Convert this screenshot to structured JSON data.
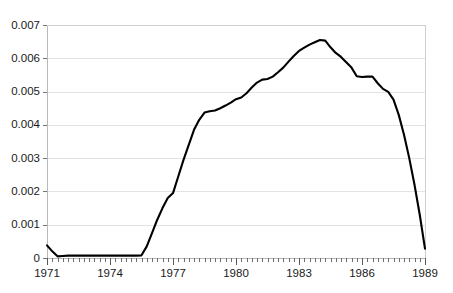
{
  "chart_data": {
    "type": "line",
    "title": "",
    "xlabel": "",
    "ylabel": "",
    "xlim": [
      1971,
      1989
    ],
    "ylim": [
      0,
      0.007
    ],
    "grid": true,
    "legend": null,
    "x_tick_labels": [
      "1971",
      "1974",
      "1977",
      "1980",
      "1983",
      "1986",
      "1989"
    ],
    "x_tick_values": [
      1971,
      1974,
      1977,
      1980,
      1983,
      1986,
      1989
    ],
    "x_minor_tick_interval": 0.25,
    "y_tick_labels": [
      "0",
      "0.001",
      "0.002",
      "0.003",
      "0.004",
      "0.005",
      "0.006",
      "0.007"
    ],
    "y_tick_values": [
      0,
      0.001,
      0.002,
      0.003,
      0.004,
      0.005,
      0.006,
      0.007
    ],
    "series": [
      {
        "name": "series-1",
        "color": "#000000",
        "x": [
          1971.0,
          1971.25,
          1971.5,
          1971.75,
          1972.0,
          1972.25,
          1972.5,
          1972.75,
          1973.0,
          1973.25,
          1973.5,
          1973.75,
          1974.0,
          1974.25,
          1974.5,
          1974.75,
          1975.0,
          1975.25,
          1975.5,
          1975.75,
          1976.0,
          1976.25,
          1976.5,
          1976.75,
          1977.0,
          1977.25,
          1977.5,
          1977.75,
          1978.0,
          1978.25,
          1978.5,
          1978.75,
          1979.0,
          1979.25,
          1979.5,
          1979.75,
          1980.0,
          1980.25,
          1980.5,
          1980.75,
          1981.0,
          1981.25,
          1981.5,
          1981.75,
          1982.0,
          1982.25,
          1982.5,
          1982.75,
          1983.0,
          1983.25,
          1983.5,
          1983.75,
          1984.0,
          1984.25,
          1984.5,
          1984.75,
          1985.0,
          1985.25,
          1985.5,
          1985.75,
          1986.0,
          1986.25,
          1986.5,
          1986.75,
          1987.0,
          1987.25,
          1987.5,
          1987.75,
          1988.0,
          1988.25,
          1988.5,
          1988.75,
          1989.0
        ],
        "y": [
          0.00038,
          0.0002,
          5e-05,
          6e-05,
          7e-05,
          7e-05,
          7e-05,
          7e-05,
          7e-05,
          7e-05,
          7e-05,
          7e-05,
          7e-05,
          7e-05,
          7e-05,
          7e-05,
          7e-05,
          7e-05,
          8e-05,
          0.00035,
          0.00075,
          0.00115,
          0.0015,
          0.0018,
          0.00195,
          0.00245,
          0.00295,
          0.0034,
          0.00385,
          0.00415,
          0.00437,
          0.00441,
          0.00443,
          0.0045,
          0.00458,
          0.00467,
          0.00477,
          0.00482,
          0.00495,
          0.00512,
          0.00527,
          0.00536,
          0.00538,
          0.00545,
          0.00558,
          0.00572,
          0.0059,
          0.00607,
          0.00622,
          0.00632,
          0.00641,
          0.00648,
          0.00655,
          0.00653,
          0.00633,
          0.00616,
          0.00604,
          0.00588,
          0.00572,
          0.00546,
          0.00544,
          0.00545,
          0.00545,
          0.00525,
          0.00508,
          0.00499,
          0.00476,
          0.0043,
          0.0037,
          0.003,
          0.0022,
          0.0013,
          0.00028
        ]
      }
    ]
  }
}
